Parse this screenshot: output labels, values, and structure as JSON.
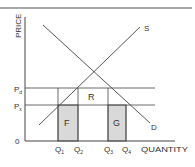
{
  "diagram": {
    "type": "supply-demand",
    "y_axis_label": "PRICE",
    "x_axis_label": "QUANTITY",
    "origin_label": "0",
    "price_levels": [
      {
        "label": "P",
        "sub": "d"
      },
      {
        "label": "P",
        "sub": "x"
      }
    ],
    "quantity_levels": [
      {
        "label": "Q",
        "sub": "1"
      },
      {
        "label": "Q",
        "sub": "2"
      },
      {
        "label": "Q",
        "sub": "3"
      },
      {
        "label": "Q",
        "sub": "4"
      }
    ],
    "curves": {
      "supply": "S",
      "demand": "D"
    },
    "regions": {
      "left_shaded": "F",
      "middle": "R",
      "right_shaded": "G"
    },
    "colors": {
      "line": "#444444",
      "shade": "#d9d9d9",
      "text": "#333333"
    }
  }
}
